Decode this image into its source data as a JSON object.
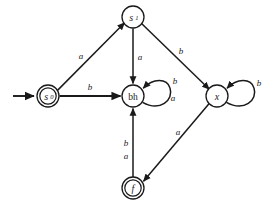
{
  "diagram": {
    "type": "finite-state-automaton",
    "title": "",
    "background_color": "#ffffff",
    "stroke_color": "#1a1a1a",
    "nodes": [
      {
        "id": "s0",
        "label": "s",
        "subscript": "0",
        "x": 48,
        "y": 96,
        "radius": 11,
        "accepting": true,
        "start": true,
        "italic": true
      },
      {
        "id": "s1",
        "label": "s",
        "subscript": "1",
        "x": 133,
        "y": 17,
        "radius": 11,
        "accepting": false,
        "start": false,
        "italic": true
      },
      {
        "id": "bh",
        "label": "bh",
        "subscript": "",
        "x": 133,
        "y": 96,
        "radius": 11,
        "accepting": false,
        "start": false,
        "italic": false
      },
      {
        "id": "x",
        "label": "x",
        "subscript": "",
        "x": 217,
        "y": 96,
        "radius": 11,
        "accepting": false,
        "start": false,
        "italic": true
      },
      {
        "id": "f",
        "label": "f",
        "subscript": "",
        "x": 133,
        "y": 188,
        "radius": 11,
        "accepting": true,
        "start": false,
        "italic": true
      }
    ],
    "edges": [
      {
        "id": "e-s0-s1",
        "from": "s0",
        "to": "s1",
        "label": "a",
        "label_x": 81,
        "label_y": 56
      },
      {
        "id": "e-s0-bh",
        "from": "s0",
        "to": "bh",
        "label": "b",
        "label_x": 90,
        "label_y": 87
      },
      {
        "id": "e-s1-bh",
        "from": "s1",
        "to": "bh",
        "label": "a",
        "label_x": 140,
        "label_y": 57
      },
      {
        "id": "e-s1-x",
        "from": "s1",
        "to": "x",
        "label": "b",
        "label_x": 181,
        "label_y": 51
      },
      {
        "id": "e-bh-bh-b",
        "from": "bh",
        "to": "bh",
        "label": "b",
        "label_x": 175,
        "label_y": 81
      },
      {
        "id": "e-bh-bh-a",
        "from": "bh",
        "to": "bh",
        "label": "a",
        "label_x": 173,
        "label_y": 98
      },
      {
        "id": "e-x-x",
        "from": "x",
        "to": "x",
        "label": "b",
        "label_x": 259,
        "label_y": 83
      },
      {
        "id": "e-x-f",
        "from": "x",
        "to": "f",
        "label": "a",
        "label_x": 178,
        "label_y": 132
      },
      {
        "id": "e-f-bh-b",
        "from": "f",
        "to": "bh",
        "label": "b",
        "label_x": 126,
        "label_y": 143
      },
      {
        "id": "e-f-bh-a",
        "from": "f",
        "to": "bh",
        "label": "a",
        "label_x": 126,
        "label_y": 156
      }
    ],
    "start_arrow": {
      "id": "start-arrow",
      "from_x": 13,
      "from_y": 96,
      "to_x": 35,
      "to_y": 96
    },
    "alphabet": [
      "a",
      "b"
    ]
  }
}
